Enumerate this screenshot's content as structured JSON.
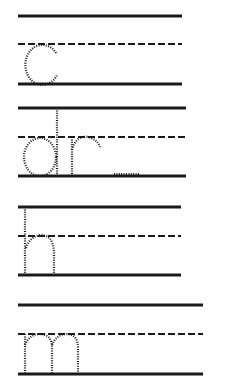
{
  "worksheet": {
    "title": "Handwriting practice - letter tracing",
    "ink_color": "#1a1a1a",
    "background": "#ffffff",
    "rows": [
      {
        "letters": "c",
        "top": 16,
        "mid": 44,
        "base": 84,
        "x1": 18,
        "x2": 182
      },
      {
        "letters": "dr",
        "top": 108,
        "mid": 137,
        "base": 176,
        "x1": 18,
        "x2": 186
      },
      {
        "letters": "h",
        "top": 207,
        "mid": 236,
        "base": 275,
        "x1": 18,
        "x2": 181
      },
      {
        "letters": "m",
        "top": 305,
        "mid": 334,
        "base": 374,
        "x1": 18,
        "x2": 203
      }
    ]
  }
}
